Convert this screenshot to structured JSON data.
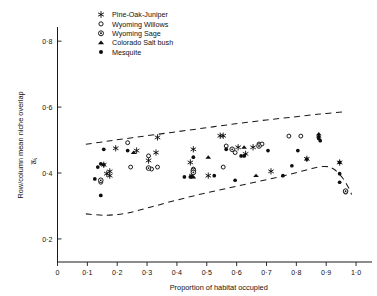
{
  "chart_data": {
    "type": "scatter",
    "title": "",
    "xlabel": "Proportion of habitat occupied",
    "ylabel": "Row/column mean niche overlap",
    "ylabel_symbol": "a̅ᵢⱼ",
    "xlim": [
      0,
      1.04
    ],
    "ylim": [
      0.13,
      0.84
    ],
    "xticks": [
      0,
      0.1,
      0.2,
      0.3,
      0.4,
      0.5,
      0.6,
      0.7,
      0.8,
      0.9,
      1.0
    ],
    "xticklabels": [
      "0",
      "0·1",
      "0·2",
      "0·3",
      "0·4",
      "0·5",
      "0·6",
      "0·7",
      "0·8",
      "0·9",
      "1·0"
    ],
    "yticks": [
      0.2,
      0.4,
      0.6,
      0.8
    ],
    "yticklabels": [
      "0·2",
      "0·4",
      "0·6",
      "0·8"
    ],
    "grid": false,
    "legend_position": "top-left-inside",
    "marker_color": "#0d0d0d",
    "series": [
      {
        "name": "Pine-Oak-Juniper",
        "marker": "asterisk",
        "points": [
          [
            0.155,
            0.425
          ],
          [
            0.195,
            0.475
          ],
          [
            0.265,
            0.468
          ],
          [
            0.33,
            0.462
          ],
          [
            0.305,
            0.438
          ],
          [
            0.165,
            0.398
          ],
          [
            0.175,
            0.392
          ],
          [
            0.455,
            0.472
          ],
          [
            0.445,
            0.432
          ],
          [
            0.505,
            0.392
          ],
          [
            0.545,
            0.513
          ],
          [
            0.555,
            0.513
          ],
          [
            0.605,
            0.478
          ],
          [
            0.655,
            0.478
          ],
          [
            0.45,
            0.392
          ],
          [
            0.335,
            0.508
          ],
          [
            0.715,
            0.405
          ],
          [
            0.835,
            0.443
          ],
          [
            0.945,
            0.432
          ],
          [
            0.63,
            0.458
          ],
          [
            0.175,
            0.405
          ]
        ]
      },
      {
        "name": "Wyoming Willows",
        "marker": "open-circle",
        "points": [
          [
            0.145,
            0.372
          ],
          [
            0.235,
            0.492
          ],
          [
            0.305,
            0.452
          ],
          [
            0.245,
            0.418
          ],
          [
            0.315,
            0.412
          ],
          [
            0.555,
            0.418
          ],
          [
            0.455,
            0.412
          ],
          [
            0.565,
            0.482
          ],
          [
            0.595,
            0.462
          ],
          [
            0.675,
            0.488
          ],
          [
            0.775,
            0.512
          ],
          [
            0.815,
            0.512
          ],
          [
            0.685,
            0.488
          ],
          [
            0.965,
            0.342
          ],
          [
            0.335,
            0.418
          ]
        ]
      },
      {
        "name": "Wyoming Sage",
        "marker": "dot-circle",
        "points": [
          [
            0.145,
            0.378
          ],
          [
            0.455,
            0.408
          ],
          [
            0.455,
            0.402
          ],
          [
            0.585,
            0.472
          ],
          [
            0.675,
            0.482
          ],
          [
            0.965,
            0.345
          ],
          [
            0.305,
            0.415
          ]
        ]
      },
      {
        "name": "Colorado Salt bush",
        "marker": "triangle",
        "points": [
          [
            0.255,
            0.462
          ],
          [
            0.505,
            0.448
          ],
          [
            0.625,
            0.478
          ],
          [
            0.665,
            0.392
          ],
          [
            0.875,
            0.518
          ],
          [
            0.875,
            0.512
          ],
          [
            0.455,
            0.388
          ]
        ]
      },
      {
        "name": "Mesquite",
        "marker": "filled-circle",
        "points": [
          [
            0.145,
            0.428
          ],
          [
            0.155,
            0.425
          ],
          [
            0.135,
            0.418
          ],
          [
            0.125,
            0.382
          ],
          [
            0.145,
            0.332
          ],
          [
            0.235,
            0.468
          ],
          [
            0.455,
            0.448
          ],
          [
            0.525,
            0.392
          ],
          [
            0.565,
            0.472
          ],
          [
            0.615,
            0.452
          ],
          [
            0.625,
            0.452
          ],
          [
            0.705,
            0.468
          ],
          [
            0.595,
            0.378
          ],
          [
            0.805,
            0.468
          ],
          [
            0.785,
            0.422
          ],
          [
            0.875,
            0.505
          ],
          [
            0.88,
            0.498
          ],
          [
            0.835,
            0.442
          ],
          [
            0.945,
            0.432
          ],
          [
            0.945,
            0.398
          ],
          [
            0.945,
            0.372
          ],
          [
            0.155,
            0.472
          ],
          [
            0.425,
            0.388
          ],
          [
            0.445,
            0.388
          ],
          [
            0.755,
            0.392
          ]
        ]
      }
    ],
    "envelopes": [
      {
        "name": "upper-bound",
        "style": "dashed",
        "points": [
          [
            0.095,
            0.487
          ],
          [
            0.17,
            0.497
          ],
          [
            0.25,
            0.507
          ],
          [
            0.34,
            0.518
          ],
          [
            0.43,
            0.529
          ],
          [
            0.52,
            0.54
          ],
          [
            0.61,
            0.551
          ],
          [
            0.7,
            0.561
          ],
          [
            0.79,
            0.57
          ],
          [
            0.88,
            0.579
          ],
          [
            0.955,
            0.585
          ]
        ]
      },
      {
        "name": "lower-bound",
        "style": "dashed",
        "points": [
          [
            0.095,
            0.276
          ],
          [
            0.16,
            0.272
          ],
          [
            0.23,
            0.278
          ],
          [
            0.31,
            0.296
          ],
          [
            0.4,
            0.318
          ],
          [
            0.49,
            0.338
          ],
          [
            0.58,
            0.356
          ],
          [
            0.67,
            0.374
          ],
          [
            0.76,
            0.392
          ],
          [
            0.845,
            0.412
          ],
          [
            0.895,
            0.42
          ],
          [
            0.925,
            0.412
          ],
          [
            0.955,
            0.385
          ],
          [
            0.975,
            0.355
          ],
          [
            0.985,
            0.335
          ]
        ]
      }
    ]
  },
  "legend": {
    "items": [
      {
        "label": "Pine-Oak-Juniper",
        "marker": "asterisk"
      },
      {
        "label": "Wyoming Willows",
        "marker": "open-circle"
      },
      {
        "label": "Wyoming Sage",
        "marker": "dot-circle"
      },
      {
        "label": "Colorado Salt bush",
        "marker": "triangle"
      },
      {
        "label": "Mesquite",
        "marker": "filled-circle"
      }
    ]
  }
}
